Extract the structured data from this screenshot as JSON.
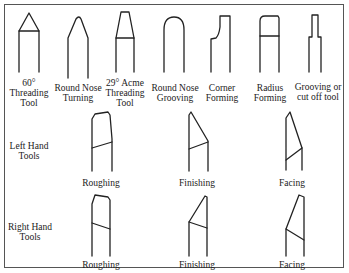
{
  "diagram": {
    "top_row": [
      {
        "id": "threading-60",
        "label": "60°\nThreading\nTool"
      },
      {
        "id": "round-nose-turning",
        "label": "Round Nose\nTurning"
      },
      {
        "id": "acme-threading-29",
        "label": "29° Acme\nThreading\nTool"
      },
      {
        "id": "round-nose-grooving",
        "label": "Round Nose\nGrooving"
      },
      {
        "id": "corner-forming",
        "label": "Corner\nForming"
      },
      {
        "id": "radius-forming",
        "label": "Radius\nForming"
      },
      {
        "id": "grooving-cutoff",
        "label": "Grooving or\ncut off tool"
      }
    ],
    "left_hand": {
      "row_label": "Left Hand\nTools",
      "tools": [
        {
          "id": "lh-roughing",
          "label": "Roughing"
        },
        {
          "id": "lh-finishing",
          "label": "Finishing"
        },
        {
          "id": "lh-facing",
          "label": "Facing"
        }
      ]
    },
    "right_hand": {
      "row_label": "Right Hand\nTools",
      "tools": [
        {
          "id": "rh-roughing",
          "label": "Roughing"
        },
        {
          "id": "rh-finishing",
          "label": "Finishing"
        },
        {
          "id": "rh-facing",
          "label": "Facing"
        }
      ]
    }
  }
}
